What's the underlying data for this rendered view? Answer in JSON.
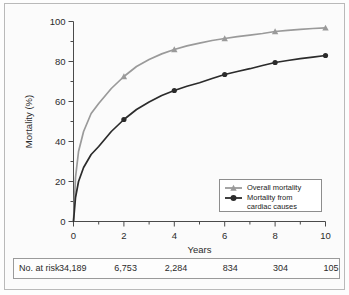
{
  "figure": {
    "background_color": "#fbfbfb",
    "frame_color": "#b9b9b9"
  },
  "chart_data": {
    "type": "line",
    "title": "",
    "subtitle": "",
    "xlabel": "Years",
    "ylabel": "Mortality (%)",
    "xlim": [
      0,
      10
    ],
    "ylim": [
      0,
      100
    ],
    "xticks": [
      0,
      2,
      4,
      6,
      8,
      10
    ],
    "xtick_labels": [
      "0",
      "2",
      "4",
      "6",
      "8",
      "10"
    ],
    "x_minor_ticks": [
      1,
      3,
      5,
      7,
      9
    ],
    "yticks": [
      0,
      20,
      40,
      60,
      80,
      100
    ],
    "ytick_labels": [
      "0",
      "20",
      "40",
      "60",
      "80",
      "100"
    ],
    "y_minor_ticks": [
      10,
      30,
      50,
      70,
      90
    ],
    "grid": false,
    "legend_position": "lower right",
    "x": [
      0,
      0.08,
      0.2,
      0.4,
      0.7,
      1,
      1.5,
      2,
      2.5,
      3,
      3.5,
      4,
      4.5,
      5,
      5.5,
      6,
      6.5,
      7,
      7.5,
      8,
      8.5,
      9,
      9.5,
      10
    ],
    "series": [
      {
        "name": "Overall mortality",
        "color": "#9a9a9a",
        "marker": "triangle",
        "marker_x": [
          2,
          4,
          6,
          8,
          10
        ],
        "marker_values": [
          72.5,
          86,
          91.5,
          95,
          96.8
        ],
        "values": [
          0,
          22,
          35,
          45,
          54,
          59,
          66.5,
          72.5,
          77.5,
          81,
          83.8,
          86,
          87.8,
          89.2,
          90.5,
          91.5,
          92.4,
          93.2,
          94,
          95,
          95.6,
          96.1,
          96.5,
          96.8
        ]
      },
      {
        "name": "Mortality from cardiac causes",
        "color": "#2b2b2b",
        "marker": "circle",
        "marker_x": [
          2,
          4,
          6,
          8,
          10
        ],
        "marker_values": [
          51,
          65.5,
          73.5,
          79.5,
          83
        ],
        "values": [
          0,
          12,
          20,
          27,
          33.5,
          37.5,
          45,
          51,
          56,
          59.8,
          63,
          65.5,
          67.6,
          69.4,
          71.5,
          73.5,
          75,
          76.4,
          78,
          79.5,
          80.5,
          81.4,
          82.2,
          83
        ]
      }
    ],
    "legend": [
      {
        "label_line1": "Overall mortality",
        "label_line2": "",
        "color": "#9a9a9a",
        "marker": "triangle"
      },
      {
        "label_line1": "Mortality from",
        "label_line2": "cardiac causes",
        "color": "#2b2b2b",
        "marker": "circle"
      }
    ],
    "risk_table": {
      "row_label": "No. at risk",
      "columns": [
        "0",
        "2",
        "4",
        "6",
        "8",
        "10"
      ],
      "values": [
        "34,189",
        "6,753",
        "2,284",
        "834",
        "304",
        "105"
      ]
    }
  }
}
